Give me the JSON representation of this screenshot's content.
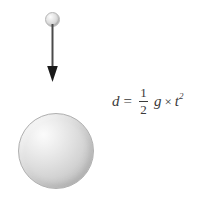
{
  "diagram": {
    "background_color": "#ffffff",
    "objects": {
      "small_ball": {
        "name": "falling-object",
        "shape": "sphere",
        "diameter_px": 15,
        "center_px": [
          52,
          19
        ],
        "fill": "#e0e0e0",
        "highlight": "#fdfdfd"
      },
      "motion_arrow": {
        "name": "downward-motion-arrow",
        "direction": "down",
        "start_px": [
          52,
          26
        ],
        "end_px": [
          52,
          82
        ],
        "color": "#3a3a3a",
        "head": "solid-triangle"
      },
      "big_ball": {
        "name": "ground-body",
        "shape": "sphere",
        "diameter_px": 76,
        "center_px": [
          56,
          151
        ],
        "fill": "#d4d4d4",
        "highlight": "#fbfbfb"
      }
    },
    "formula": {
      "label": "d = 1/2 g x t^2",
      "lhs": "d",
      "equals": "=",
      "fraction_numerator": "1",
      "fraction_denominator": "2",
      "gravity_symbol": "g",
      "multiply_symbol": "×",
      "time_symbol": "t",
      "time_exponent": "2",
      "color": "#3a3a3a"
    }
  }
}
